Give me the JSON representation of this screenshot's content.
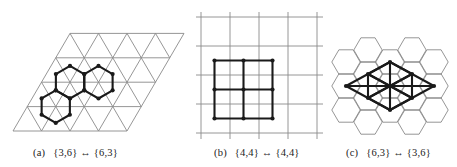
{
  "figure": {
    "panels": [
      {
        "id": "a",
        "tag": "(a)",
        "label": "{3,6} ↔ {6,3}",
        "background_tiling": "triangular {3,6}",
        "overlay_tiling": "hexagonal {6,3}",
        "overlay_count": 3
      },
      {
        "id": "b",
        "tag": "(b)",
        "label": "{4,4} ↔ {4,4}",
        "background_tiling": "square {4,4}",
        "overlay_tiling": "square {4,4}",
        "overlay_count": 4
      },
      {
        "id": "c",
        "tag": "(c)",
        "label": "{6,3} ↔ {3,6}",
        "background_tiling": "hexagonal {6,3}",
        "overlay_tiling": "triangular {3,6}",
        "overlay_count": 8
      }
    ],
    "colors": {
      "thin_line": "#8a8a8a",
      "thick_line": "#1a1a1a",
      "background": "#ffffff"
    }
  }
}
